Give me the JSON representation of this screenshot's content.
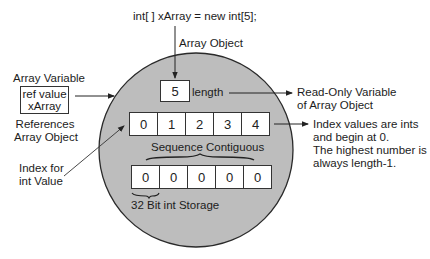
{
  "diagram": {
    "code_line": "int[ ] xArray = new int[5];",
    "array_object_label": "Array Object",
    "array_variable": {
      "title": "Array Variable",
      "box_line1": "ref value",
      "box_line2": "xArray",
      "caption_line1": "References",
      "caption_line2": "Array Object"
    },
    "length": {
      "value": "5",
      "label": "length",
      "note_line1": "Read-Only Variable",
      "note_line2": "of Array Object"
    },
    "index_row": {
      "cells": [
        "0",
        "1",
        "2",
        "3",
        "4"
      ],
      "caption": "Sequence Contiguous"
    },
    "value_row": {
      "cells": [
        "0",
        "0",
        "0",
        "0",
        "0"
      ],
      "caption": "32 Bit int Storage"
    },
    "index_for_label": {
      "line1": "Index for",
      "line2": "int Value"
    },
    "index_note": {
      "line1": "Index values are ints",
      "line2": "and begin at 0.",
      "line3": "The highest number is",
      "line4": "always length-1."
    },
    "colors": {
      "circle_fill": "#bdbdbd",
      "stroke": "#2a2a2a",
      "background": "#ffffff"
    }
  }
}
